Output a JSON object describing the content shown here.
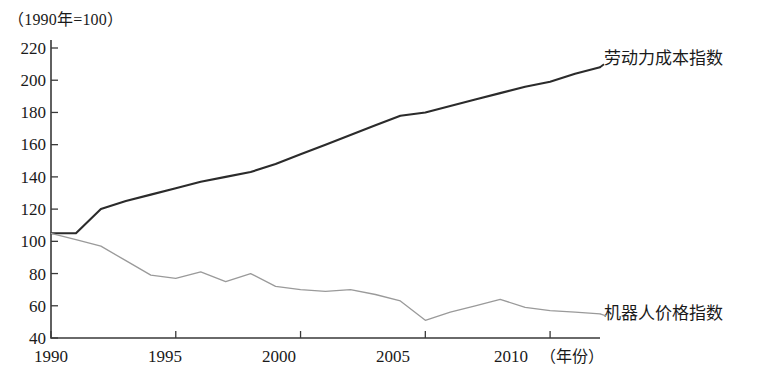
{
  "figure": {
    "unit_note": "（1990年=100）",
    "xaxis_title": "（年份）"
  },
  "chart_data": {
    "type": "line",
    "title": "",
    "subtitle": "",
    "unit_note": "（1990年=100）",
    "xlabel": "（年份）",
    "ylabel": "",
    "xlim": [
      1990,
      2012
    ],
    "ylim": [
      40,
      220
    ],
    "ytick_labels": [
      "220",
      "200",
      "180",
      "160",
      "140",
      "120",
      "100",
      "80",
      "60",
      "40"
    ],
    "yticks": [
      220,
      200,
      180,
      160,
      140,
      120,
      100,
      80,
      60,
      40
    ],
    "xtick_labels": [
      "1990",
      "1995",
      "2000",
      "2005",
      "2010"
    ],
    "xticks": [
      1990,
      1995,
      2000,
      2005,
      2010
    ],
    "grid": false,
    "legend_position": "inline-right-of-line",
    "x": [
      1990,
      1991,
      1992,
      1993,
      1994,
      1995,
      1996,
      1997,
      1998,
      1999,
      2000,
      2001,
      2002,
      2003,
      2004,
      2005,
      2006,
      2007,
      2008,
      2009,
      2010,
      2011,
      2012
    ],
    "series": [
      {
        "name": "劳动力成本指数",
        "color": "#2b2b2b",
        "values": [
          105,
          105,
          120,
          125,
          129,
          133,
          137,
          140,
          143,
          148,
          154,
          160,
          166,
          172,
          178,
          180,
          184,
          188,
          192,
          196,
          199,
          204,
          208
        ]
      },
      {
        "name": "机器人价格指数",
        "color": "#9a9a9a",
        "values": [
          105,
          101,
          97,
          88,
          79,
          77,
          81,
          75,
          80,
          72,
          70,
          69,
          70,
          67,
          63,
          51,
          56,
          60,
          64,
          59,
          57,
          56,
          55
        ]
      }
    ],
    "annotations": [
      {
        "text": "劳动力成本指数",
        "series": "劳动力成本指数",
        "position": "right-end"
      },
      {
        "text": "机器人价格指数",
        "series": "机器人价格指数",
        "position": "right-end"
      }
    ]
  }
}
